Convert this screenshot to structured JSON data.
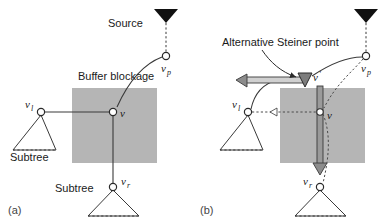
{
  "figure": {
    "colors": {
      "blockage_fill": "#b5b5b5",
      "line": "#3a3a3a",
      "text": "#1a1a1a",
      "panel_label": "#444444",
      "node_fill": "#ffffff",
      "arrow_fill": "#8c8c8c"
    }
  },
  "panels": [
    {
      "id": "a",
      "label": "(a)",
      "annotations": {
        "source": "Source",
        "blockage": "Buffer blockage",
        "subtree_left": "Subtree",
        "subtree_bottom": "Subtree"
      },
      "nodes": {
        "vp": {
          "base": "v",
          "sub": "p",
          "x": 166,
          "y": 56
        },
        "v": {
          "base": "v",
          "sub": "",
          "x": 113,
          "y": 112
        },
        "vl": {
          "base": "v",
          "sub": "l",
          "x": 41,
          "y": 112
        },
        "vr": {
          "base": "v",
          "sub": "r",
          "x": 113,
          "y": 187
        }
      },
      "blockage_rect": {
        "x": 72,
        "y": 88,
        "w": 85,
        "h": 75
      }
    },
    {
      "id": "b",
      "label": "(b)",
      "annotations": {
        "alternative_steiner_point": "Alternative Steiner point"
      },
      "nodes": {
        "vp": {
          "base": "v",
          "sub": "p",
          "x": 366,
          "y": 56
        },
        "vprime": {
          "base": "v",
          "sub": "'",
          "x": 305,
          "y": 80
        },
        "v": {
          "base": "v",
          "sub": "",
          "x": 320,
          "y": 112
        },
        "vl": {
          "base": "v",
          "sub": "l",
          "x": 248,
          "y": 112
        },
        "vr": {
          "base": "v",
          "sub": "r",
          "x": 320,
          "y": 187
        }
      },
      "blockage_rect": {
        "x": 280,
        "y": 88,
        "w": 85,
        "h": 75
      }
    }
  ],
  "labels": {
    "source_a": "Source",
    "buffer_blockage_a": "Buffer blockage",
    "subtree_left_a": "Subtree",
    "subtree_bottom_a": "Subtree",
    "alt_steiner_b": "Alternative Steiner point",
    "panel_a": "(a)",
    "panel_b": "(b)",
    "v_base": "v",
    "sub_p": "p",
    "sub_l": "l",
    "sub_r": "r",
    "prime": "'"
  }
}
